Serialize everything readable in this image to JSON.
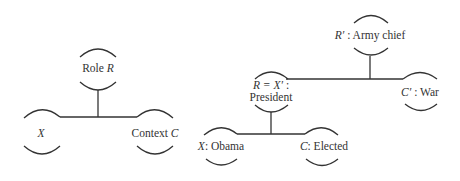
{
  "diagram": {
    "left_tree": {
      "role": {
        "label": "Role ",
        "var": "R"
      },
      "left": {
        "var": "X"
      },
      "right": {
        "label": "Context ",
        "var": "C"
      }
    },
    "right_tree": {
      "top": {
        "var": "R′",
        "label": " : Army chief"
      },
      "middle": {
        "line1_var": "R = X′",
        "line1_suffix": " :",
        "line2": "President"
      },
      "right": {
        "var": "C′",
        "label": " : War"
      },
      "bottom_left": {
        "var": "X",
        "label": ": Obama"
      },
      "bottom_right": {
        "var": "C",
        "label": ": Elected"
      }
    },
    "colors": {
      "ink": "#333333",
      "background": "#ffffff"
    }
  }
}
